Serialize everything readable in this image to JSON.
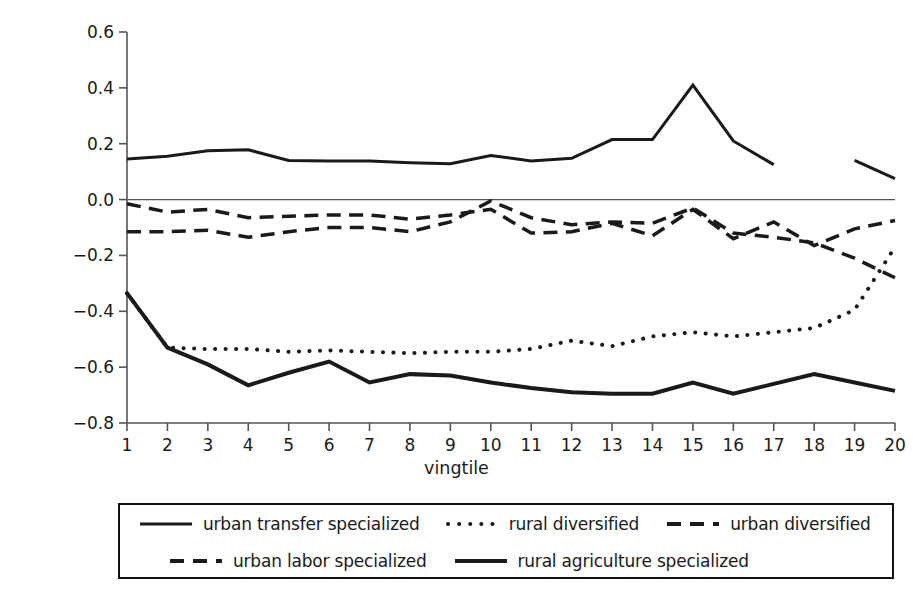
{
  "chart_data": {
    "type": "line",
    "title": "",
    "xlabel": "vingtile",
    "ylabel": "equivalent variation as a % of income",
    "xlim": [
      1,
      20
    ],
    "ylim": [
      -0.8,
      0.6
    ],
    "grid": false,
    "legend_position": "bottom",
    "x": [
      1,
      2,
      3,
      4,
      5,
      6,
      7,
      8,
      9,
      10,
      11,
      12,
      13,
      14,
      15,
      16,
      17,
      18,
      19,
      20
    ],
    "xticks": [
      "1",
      "2",
      "3",
      "4",
      "5",
      "6",
      "7",
      "8",
      "9",
      "10",
      "11",
      "12",
      "13",
      "14",
      "15",
      "16",
      "17",
      "18",
      "19",
      "20"
    ],
    "yticks": [
      "0.6",
      "0.4",
      "0.2",
      "0.0",
      "-0.2",
      "-0.4",
      "-0.6",
      "-0.8"
    ],
    "ytick_values": [
      0.6,
      0.4,
      0.2,
      0.0,
      -0.2,
      -0.4,
      -0.6,
      -0.8
    ],
    "zero_line": 0.0,
    "series": [
      {
        "name": "urban transfer specialized",
        "style": "solid",
        "width": 3,
        "color": "#1a1a1a",
        "values": [
          0.145,
          0.155,
          0.175,
          0.178,
          0.14,
          0.138,
          0.138,
          0.132,
          0.128,
          0.158,
          0.138,
          0.148,
          0.215,
          0.215,
          0.41,
          0.21,
          0.125,
          null,
          0.14,
          0.075
        ]
      },
      {
        "name": "rural diversified",
        "style": "dotted",
        "width": 4,
        "color": "#1a1a1a",
        "values": [
          -0.335,
          -0.53,
          -0.535,
          -0.535,
          -0.545,
          -0.54,
          -0.545,
          -0.55,
          -0.545,
          -0.545,
          -0.535,
          -0.505,
          -0.525,
          -0.49,
          -0.475,
          -0.49,
          -0.475,
          -0.46,
          -0.395,
          -0.17
        ]
      },
      {
        "name": "urban diversified",
        "style": "dashed",
        "width": 3.5,
        "color": "#1a1a1a",
        "values": [
          -0.015,
          -0.045,
          -0.035,
          -0.065,
          -0.06,
          -0.055,
          -0.055,
          -0.07,
          -0.055,
          -0.035,
          -0.12,
          -0.115,
          -0.085,
          -0.13,
          -0.035,
          -0.14,
          -0.08,
          -0.165,
          -0.105,
          -0.075
        ]
      },
      {
        "name": "urban labor specialized",
        "style": "dashed",
        "width": 3.5,
        "color": "#1a1a1a",
        "values": [
          -0.115,
          -0.115,
          -0.11,
          -0.135,
          -0.115,
          -0.1,
          -0.1,
          -0.115,
          -0.08,
          -0.005,
          -0.065,
          -0.09,
          -0.08,
          -0.085,
          -0.03,
          -0.12,
          -0.135,
          -0.155,
          -0.21,
          -0.28
        ]
      },
      {
        "name": "rural agriculture specialized",
        "style": "solid",
        "width": 4,
        "color": "#1a1a1a",
        "values": [
          -0.335,
          -0.53,
          -0.59,
          -0.665,
          -0.62,
          -0.58,
          -0.655,
          -0.625,
          -0.63,
          -0.655,
          -0.675,
          -0.69,
          -0.695,
          -0.695,
          -0.655,
          -0.695,
          -0.66,
          -0.625,
          -0.655,
          -0.685
        ]
      }
    ]
  },
  "legend": {
    "rows": [
      [
        {
          "label": "urban transfer specialized",
          "style": "solid",
          "width": 3
        },
        {
          "label": "rural diversified",
          "style": "dotted",
          "width": 4
        },
        {
          "label": "urban diversified",
          "style": "dashed",
          "width": 4
        }
      ],
      [
        {
          "label": "urban labor specialized",
          "style": "dashed",
          "width": 4
        },
        {
          "label": "rural agriculture specialized",
          "style": "solid",
          "width": 4
        }
      ]
    ]
  },
  "colors": {
    "ink": "#1a1a1a",
    "axis": "#555555",
    "background": "#ffffff"
  }
}
